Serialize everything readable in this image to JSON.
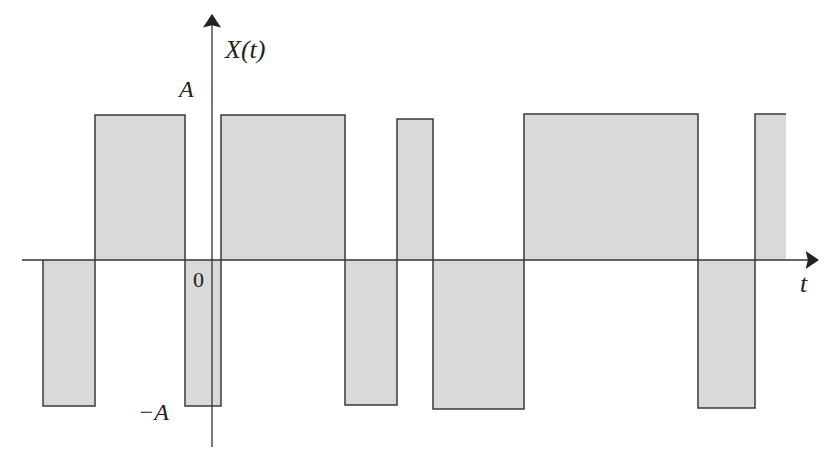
{
  "diagram": {
    "y_axis_label": "X(t)",
    "x_axis_label": "t",
    "origin_label": "0",
    "level_high_label": "A",
    "level_low_label": "−A",
    "colors": {
      "fill": "#d9d9d9",
      "stroke": "#3a3a3a",
      "axis": "#333333"
    },
    "axes": {
      "x_axis_y": 260,
      "x_start": 22,
      "x_end": 818,
      "y_axis_x": 212,
      "y_start": 447,
      "y_end": 15
    },
    "pulses": [
      {
        "x0": 43,
        "x1": 95,
        "level": "low",
        "y": 406
      },
      {
        "x0": 95,
        "x1": 185,
        "level": "high",
        "y": 115
      },
      {
        "x0": 185,
        "x1": 221,
        "level": "low",
        "y": 406
      },
      {
        "x0": 221,
        "x1": 345,
        "level": "high",
        "y": 115
      },
      {
        "x0": 345,
        "x1": 397,
        "level": "low",
        "y": 405
      },
      {
        "x0": 397,
        "x1": 433,
        "level": "high",
        "y": 119
      },
      {
        "x0": 433,
        "x1": 524,
        "level": "low",
        "y": 409
      },
      {
        "x0": 524,
        "x1": 698,
        "level": "high",
        "y": 114
      },
      {
        "x0": 698,
        "x1": 755,
        "level": "low",
        "y": 408
      },
      {
        "x0": 755,
        "x1": 786,
        "level": "high",
        "y": 114
      }
    ]
  }
}
